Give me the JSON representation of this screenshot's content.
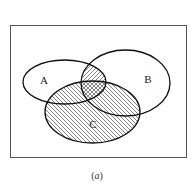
{
  "diagram": {
    "type": "venn",
    "universe": {
      "x": 10,
      "y": 25,
      "width": 176,
      "height": 132
    },
    "sets": [
      {
        "id": "A",
        "label": "A",
        "cx": 64.5,
        "cy": 82,
        "rx": 41.5,
        "ry": 22,
        "label_x": 44,
        "label_y": 84
      },
      {
        "id": "B",
        "label": "B",
        "cx": 125.5,
        "cy": 83,
        "rx": 44.5,
        "ry": 33,
        "label_x": 148,
        "label_y": 83
      },
      {
        "id": "C",
        "label": "C",
        "cx": 92.5,
        "cy": 112,
        "rx": 47.5,
        "ry": 31,
        "label_x": 93,
        "label_y": 128
      }
    ],
    "shaded_regions": [
      {
        "region": "C",
        "pattern": "diagonal-down-hatch"
      },
      {
        "region": "A∩B",
        "pattern": "diagonal-up-hatch"
      },
      {
        "region": "A∩B∩C",
        "pattern": "crosshatch"
      }
    ],
    "colors": {
      "stroke": "#111111",
      "hatch": "#333333",
      "border": "#555555"
    }
  },
  "caption": {
    "open": "(",
    "letter": "a",
    "close": ")"
  }
}
